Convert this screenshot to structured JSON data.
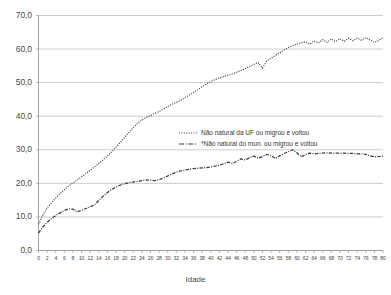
{
  "chart_data": {
    "type": "line",
    "title": "",
    "xlabel": "Idade",
    "ylabel": "",
    "xlim": [
      0,
      80
    ],
    "ylim": [
      0,
      70
    ],
    "grid": true,
    "legend_position": "inside-center",
    "y_ticks": [
      "0,0",
      "10,0",
      "20,0",
      "30,0",
      "40,0",
      "50,0",
      "60,0",
      "70,0"
    ],
    "x_ticks": [
      0,
      2,
      4,
      6,
      8,
      10,
      12,
      14,
      16,
      18,
      20,
      22,
      24,
      26,
      28,
      30,
      32,
      34,
      36,
      38,
      40,
      42,
      44,
      46,
      48,
      50,
      52,
      54,
      56,
      58,
      60,
      62,
      64,
      66,
      68,
      70,
      72,
      74,
      76,
      78,
      80
    ],
    "x": [
      0,
      1,
      2,
      3,
      4,
      5,
      6,
      7,
      8,
      9,
      10,
      11,
      12,
      13,
      14,
      15,
      16,
      17,
      18,
      19,
      20,
      21,
      22,
      23,
      24,
      25,
      26,
      27,
      28,
      29,
      30,
      31,
      32,
      33,
      34,
      35,
      36,
      37,
      38,
      39,
      40,
      41,
      42,
      43,
      44,
      45,
      46,
      47,
      48,
      49,
      50,
      51,
      52,
      53,
      54,
      55,
      56,
      57,
      58,
      59,
      60,
      61,
      62,
      63,
      64,
      65,
      66,
      67,
      68,
      69,
      70,
      71,
      72,
      73,
      74,
      75,
      76,
      77,
      78,
      79,
      80
    ],
    "series": [
      {
        "name": "Não natural da UF ou migrou e voltou",
        "marker": "dotted",
        "color": "#404040",
        "values": [
          7.8,
          10.5,
          12.6,
          14.2,
          15.6,
          16.9,
          18.1,
          19.2,
          20.1,
          21.0,
          22.0,
          22.9,
          23.9,
          24.9,
          25.9,
          27.0,
          28.2,
          29.4,
          30.8,
          32.2,
          33.7,
          35.2,
          36.6,
          37.9,
          38.9,
          39.6,
          40.2,
          40.8,
          41.4,
          42.1,
          42.9,
          43.6,
          44.1,
          44.7,
          45.5,
          46.3,
          47.1,
          47.9,
          48.8,
          49.6,
          50.3,
          50.9,
          51.4,
          51.8,
          52.2,
          52.6,
          53.1,
          53.6,
          54.2,
          54.8,
          55.4,
          56.0,
          54.3,
          56.5,
          57.3,
          58.1,
          58.9,
          59.7,
          60.4,
          61.0,
          61.5,
          61.9,
          62.2,
          61.5,
          62.4,
          61.8,
          62.8,
          62.0,
          63.0,
          62.2,
          63.1,
          62.3,
          63.2,
          62.5,
          63.3,
          62.6,
          63.4,
          62.7,
          62.0,
          62.6,
          63.4
        ]
      },
      {
        "name": "*Não natural do mun. ou migrou e voltou",
        "marker": "dash-dot",
        "color": "#3a3a3a",
        "values": [
          5.2,
          7.0,
          8.4,
          9.5,
          10.4,
          11.2,
          11.9,
          12.4,
          12.3,
          11.5,
          12.0,
          12.5,
          13.0,
          13.6,
          14.9,
          16.2,
          17.3,
          18.2,
          18.9,
          19.5,
          19.9,
          20.2,
          20.4,
          20.6,
          20.8,
          21.0,
          21.0,
          20.8,
          21.1,
          21.6,
          22.2,
          22.8,
          23.3,
          23.7,
          24.0,
          24.2,
          24.4,
          24.5,
          24.6,
          24.7,
          24.9,
          25.1,
          25.4,
          25.8,
          26.3,
          26.0,
          26.5,
          27.3,
          27.0,
          27.6,
          28.1,
          27.5,
          28.0,
          28.6,
          28.3,
          27.4,
          28.2,
          28.9,
          29.4,
          30.0,
          29.1,
          27.9,
          28.6,
          29.0,
          28.8,
          28.9,
          29.0,
          29.1,
          29.0,
          29.0,
          29.0,
          29.0,
          28.9,
          28.9,
          28.8,
          28.8,
          28.6,
          28.2,
          27.9,
          28.0,
          28.1
        ]
      }
    ]
  }
}
